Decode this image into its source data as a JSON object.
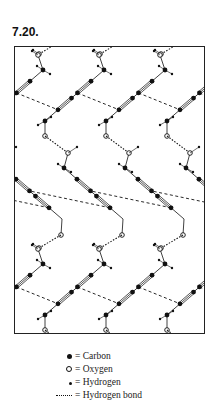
{
  "figure": {
    "label": "7.20."
  },
  "legend": {
    "items": [
      {
        "symbol": "carbon",
        "text": "= Carbon"
      },
      {
        "symbol": "oxygen",
        "text": "= Oxygen"
      },
      {
        "symbol": "hydrogen",
        "text": "= Hydrogen"
      },
      {
        "symbol": "hbond",
        "text": "= Hydrogen bond"
      }
    ]
  },
  "diagram": {
    "atom_types": [
      "carbon",
      "oxygen",
      "hydrogen"
    ],
    "bond_types": [
      "single",
      "triple",
      "hydrogen-bond",
      "contact"
    ],
    "period_x": 61,
    "period_y": 194,
    "colors": {
      "ink": "#111111",
      "frame": "#222222",
      "background": "#ffffff"
    }
  }
}
